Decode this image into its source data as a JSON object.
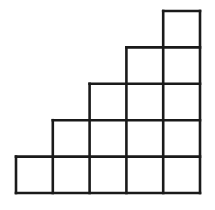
{
  "figure": {
    "kind": "staircase-of-unit-squares",
    "total_squares": 15,
    "column_count": 5,
    "row_count": 5,
    "column_heights": [
      1,
      2,
      3,
      4,
      5
    ],
    "row_widths": [
      5,
      4,
      3,
      2,
      1
    ],
    "colors": {
      "background": "#ffffff",
      "line": "#1a1a1a",
      "cell_fill": "#ffffff"
    },
    "geometry": {
      "cell_width": 36.8,
      "cell_height": 36.4,
      "line_width": 2.6,
      "origin_x": 16,
      "origin_y": 11,
      "x_gridlines": [
        16,
        52.8,
        89.6,
        126.4,
        163.2,
        200
      ],
      "y_gridlines": [
        11,
        47.4,
        83.8,
        120.2,
        156.6,
        193
      ]
    },
    "cells": [
      {
        "col": 1,
        "row": 1
      },
      {
        "col": 2,
        "row": 1
      },
      {
        "col": 2,
        "row": 2
      },
      {
        "col": 3,
        "row": 1
      },
      {
        "col": 3,
        "row": 2
      },
      {
        "col": 3,
        "row": 3
      },
      {
        "col": 4,
        "row": 1
      },
      {
        "col": 4,
        "row": 2
      },
      {
        "col": 4,
        "row": 3
      },
      {
        "col": 4,
        "row": 4
      },
      {
        "col": 5,
        "row": 1
      },
      {
        "col": 5,
        "row": 2
      },
      {
        "col": 5,
        "row": 3
      },
      {
        "col": 5,
        "row": 4
      },
      {
        "col": 5,
        "row": 5
      }
    ]
  },
  "chart_data": {
    "type": "bar",
    "title": "",
    "xlabel": "",
    "ylabel": "",
    "categories": [
      "1",
      "2",
      "3",
      "4",
      "5"
    ],
    "values": [
      1,
      2,
      3,
      4,
      5
    ],
    "ylim": [
      0,
      5
    ],
    "grid": true,
    "legend": "none"
  }
}
